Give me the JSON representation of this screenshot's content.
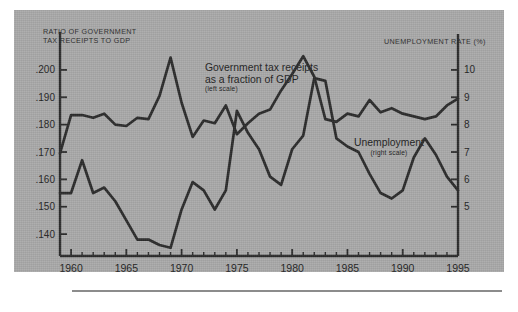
{
  "figure": {
    "background_color": "#a9a9a9",
    "page_color": "#ffffff",
    "line_color": "#2b2b2b",
    "text_color": "#1d1d1d",
    "left_axis_header": "RATIO OF GOVERNMENT\nTAX RECEIPTS TO GDP",
    "right_axis_header": "UNEMPLOYMENT RATE (%)"
  },
  "annotations": {
    "tax": {
      "line1": "Government tax receipts",
      "line2": "as a fraction of GDP",
      "scale_note": "(left scale)"
    },
    "unemployment": {
      "line1": "Unemployment",
      "scale_note": "(right scale)"
    }
  },
  "chart_data": {
    "type": "line",
    "title": "",
    "subtitle": "",
    "xlabel": "",
    "ylabel": "RATIO OF GOVERNMENT TAX RECEIPTS TO GDP",
    "y2label": "UNEMPLOYMENT RATE (%)",
    "grid": false,
    "legend": "inline-annotations",
    "xlim": [
      1959,
      1995
    ],
    "ylim": [
      0.132,
      0.208
    ],
    "y2lim": [
      3.2,
      10.8
    ],
    "xticks": [
      1960,
      1965,
      1970,
      1975,
      1980,
      1985,
      1990,
      1995
    ],
    "xticklabels": [
      "1960",
      "1965",
      "1970",
      "1975",
      "1980",
      "1985",
      "1990",
      "1995"
    ],
    "xminorticks": [
      1959,
      1960,
      1961,
      1962,
      1963,
      1964,
      1965,
      1966,
      1967,
      1968,
      1969,
      1970,
      1971,
      1972,
      1973,
      1974,
      1975,
      1976,
      1977,
      1978,
      1979,
      1980,
      1981,
      1982,
      1983,
      1984,
      1985,
      1986,
      1987,
      1988,
      1989,
      1990,
      1991,
      1992,
      1993,
      1994,
      1995
    ],
    "yticks": [
      0.14,
      0.15,
      0.16,
      0.17,
      0.18,
      0.19,
      0.2
    ],
    "yticklabels": [
      ".140",
      ".150",
      ".160",
      ".170",
      ".180",
      ".190",
      ".200"
    ],
    "y2ticks": [
      5,
      6,
      7,
      8,
      9,
      10
    ],
    "y2ticklabels": [
      "5",
      "6",
      "7",
      "8",
      "9",
      "10"
    ],
    "x": [
      1959,
      1960,
      1961,
      1962,
      1963,
      1964,
      1965,
      1966,
      1967,
      1968,
      1969,
      1970,
      1971,
      1972,
      1973,
      1974,
      1975,
      1976,
      1977,
      1978,
      1979,
      1980,
      1981,
      1982,
      1983,
      1984,
      1985,
      1986,
      1987,
      1988,
      1989,
      1990,
      1991,
      1992,
      1993,
      1994,
      1995
    ],
    "series": [
      {
        "name": "Government tax receipts as a fraction of GDP",
        "axis": "left",
        "values": [
          0.1695,
          0.1835,
          0.1835,
          0.1825,
          0.184,
          0.18,
          0.1795,
          0.1825,
          0.182,
          0.1905,
          0.2045,
          0.188,
          0.1755,
          0.1815,
          0.1805,
          0.187,
          0.1765,
          0.1805,
          0.184,
          0.1855,
          0.1925,
          0.1985,
          0.205,
          0.1975,
          0.182,
          0.181,
          0.184,
          0.183,
          0.189,
          0.1845,
          0.186,
          0.184,
          0.183,
          0.182,
          0.183,
          0.187,
          0.1895
        ]
      },
      {
        "name": "Unemployment",
        "axis": "right",
        "values": [
          5.5,
          5.5,
          6.7,
          5.5,
          5.7,
          5.2,
          4.5,
          3.8,
          3.8,
          3.6,
          3.5,
          4.9,
          5.9,
          5.6,
          4.9,
          5.6,
          8.5,
          7.7,
          7.1,
          6.1,
          5.8,
          7.1,
          7.6,
          9.7,
          9.6,
          7.5,
          7.2,
          7.0,
          6.2,
          5.5,
          5.3,
          5.6,
          6.8,
          7.5,
          6.9,
          6.1,
          5.6
        ]
      }
    ]
  }
}
